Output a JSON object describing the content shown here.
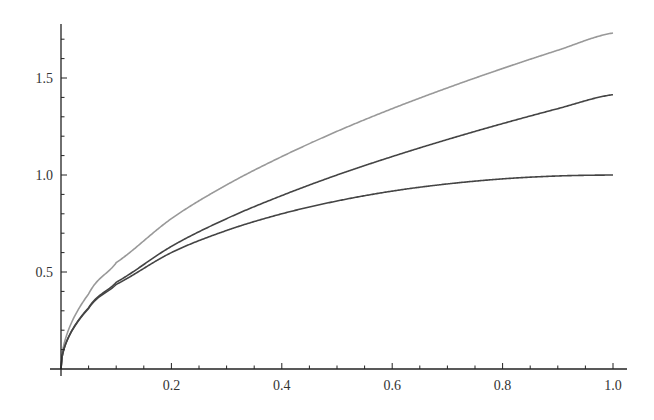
{
  "chart_data": {
    "type": "line",
    "title": "",
    "xlabel": "",
    "ylabel": "",
    "xlim": [
      0,
      1.0
    ],
    "ylim": [
      0,
      1.78
    ],
    "x_ticks": [
      "0.2",
      "0.4",
      "0.6",
      "0.8",
      "1.0"
    ],
    "y_ticks": [
      "0.5",
      "1.0",
      "1.5"
    ],
    "grid": false,
    "legend": null,
    "series": [
      {
        "name": "upper (light gray)",
        "color": "#999999",
        "x": [
          0,
          0.05,
          0.1,
          0.2,
          0.3,
          0.4,
          0.5,
          0.6,
          0.7,
          0.8,
          0.9,
          1.0
        ],
        "values": [
          0,
          0.387,
          0.548,
          0.775,
          0.949,
          1.095,
          1.225,
          1.342,
          1.449,
          1.549,
          1.643,
          1.732
        ]
      },
      {
        "name": "middle (dark)",
        "color": "#444444",
        "x": [
          0,
          0.05,
          0.1,
          0.2,
          0.3,
          0.4,
          0.5,
          0.6,
          0.7,
          0.8,
          0.9,
          1.0
        ],
        "values": [
          0,
          0.316,
          0.447,
          0.632,
          0.775,
          0.894,
          1.0,
          1.095,
          1.183,
          1.265,
          1.342,
          1.414
        ]
      },
      {
        "name": "lower (dark)",
        "color": "#444444",
        "x": [
          0,
          0.05,
          0.1,
          0.2,
          0.3,
          0.4,
          0.5,
          0.6,
          0.7,
          0.8,
          0.9,
          1.0
        ],
        "values": [
          0,
          0.312,
          0.436,
          0.6,
          0.714,
          0.8,
          0.866,
          0.917,
          0.954,
          0.98,
          0.995,
          1.0
        ]
      }
    ]
  }
}
